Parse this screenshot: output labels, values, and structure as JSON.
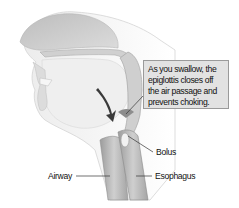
{
  "diagram": {
    "callout": {
      "text": "As you swallow, the epiglottis closes off the air passage and prevents choking."
    },
    "labels": [
      {
        "id": "bolus",
        "text": "Bolus"
      },
      {
        "id": "airway",
        "text": "Airway"
      },
      {
        "id": "esophagus",
        "text": "Esophagus"
      }
    ],
    "arrow": {
      "direction": "down",
      "meaning": "swallow direction"
    },
    "colors": {
      "callout_bg": "#e2e2e2",
      "callout_border": "#9a9a9a",
      "tissue_dark": "#a8a8a8",
      "tissue_mid": "#c9c9c9",
      "tissue_light": "#e6e6e6",
      "arrow": "#3a3a3a"
    }
  }
}
